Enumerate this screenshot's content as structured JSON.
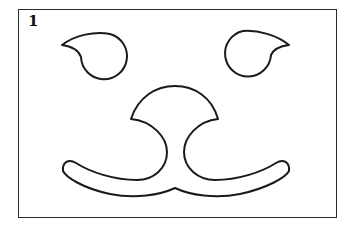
{
  "figure": {
    "label": "1",
    "stroke_color": "#1a1a1a",
    "background_color": "#ffffff",
    "parts": [
      {
        "name": "left-eye",
        "shape": "circle with pointed tip to the left"
      },
      {
        "name": "right-eye",
        "shape": "circle with pointed tip to the right"
      },
      {
        "name": "nose",
        "shape": "dome top with concave sides flowing into mouth"
      },
      {
        "name": "mouth",
        "shape": "curved rounded band meeting at a center point"
      }
    ]
  }
}
